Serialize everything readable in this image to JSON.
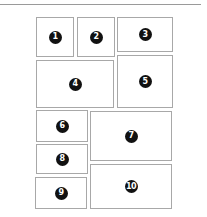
{
  "diagram": {
    "type": "panel-layout",
    "panels": [
      {
        "id": "1",
        "label": "1",
        "x": 36,
        "y": 17,
        "w": 38,
        "h": 40
      },
      {
        "id": "2",
        "label": "2",
        "x": 77,
        "y": 17,
        "w": 38,
        "h": 40
      },
      {
        "id": "3",
        "label": "3",
        "x": 117,
        "y": 17,
        "w": 56,
        "h": 35
      },
      {
        "id": "4",
        "label": "4",
        "x": 36,
        "y": 60,
        "w": 78,
        "h": 48
      },
      {
        "id": "5",
        "label": "5",
        "x": 117,
        "y": 55,
        "w": 56,
        "h": 53
      },
      {
        "id": "6",
        "label": "6",
        "x": 36,
        "y": 110,
        "w": 52,
        "h": 32
      },
      {
        "id": "7",
        "label": "7",
        "x": 90,
        "y": 111,
        "w": 82,
        "h": 50
      },
      {
        "id": "8",
        "label": "8",
        "x": 36,
        "y": 144,
        "w": 52,
        "h": 30
      },
      {
        "id": "9",
        "label": "9",
        "x": 35,
        "y": 177,
        "w": 52,
        "h": 32
      },
      {
        "id": "10",
        "label": "10",
        "x": 90,
        "y": 164,
        "w": 82,
        "h": 45
      }
    ]
  }
}
